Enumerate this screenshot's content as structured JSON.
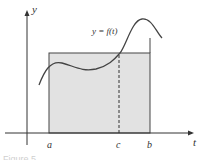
{
  "diagram": {
    "axes": {
      "x_label": "t",
      "y_label": "y"
    },
    "curve_label": "y = f(t)",
    "points": {
      "a": "a",
      "b": "b",
      "c": "c"
    },
    "caption": "Figure 5",
    "colors": {
      "fill": "#e2e2e2",
      "stroke": "#444444",
      "axis": "#333333"
    }
  }
}
